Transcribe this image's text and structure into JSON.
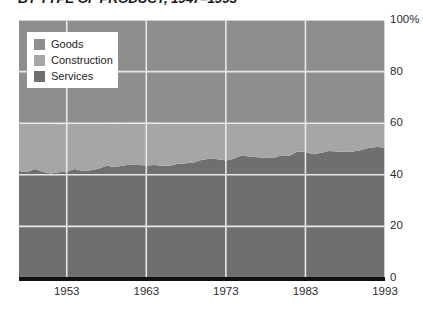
{
  "title": "BY TYPE OF PRODUCT, 1947–1993",
  "colors": {
    "goods": "#8e8e8e",
    "construction": "#a6a6a6",
    "services": "#6f6f6f",
    "gridline": "#e8e8e8",
    "baseline": "#111111",
    "text": "#2b2b2b",
    "legend_background": "#ffffff"
  },
  "legend": {
    "position": "top-left",
    "items": [
      {
        "label": "Goods",
        "color": "#8e8e8e",
        "key": "goods"
      },
      {
        "label": "Construction",
        "color": "#a6a6a6",
        "key": "construction"
      },
      {
        "label": "Services",
        "color": "#6f6f6f",
        "key": "services"
      }
    ]
  },
  "axes": {
    "y_ticks": [
      "100%",
      "80",
      "60",
      "40",
      "20",
      "0"
    ],
    "y_values": [
      100,
      80,
      60,
      40,
      20,
      0
    ],
    "x_ticks": [
      "1953",
      "1963",
      "1973",
      "1983",
      "1993"
    ],
    "x_values": [
      1953,
      1963,
      1973,
      1983,
      1993
    ]
  },
  "chart_data": {
    "type": "area",
    "stacked": true,
    "normalized": true,
    "title": "BY TYPE OF PRODUCT, 1947–1993",
    "xlabel": "",
    "ylabel": "",
    "xlim": [
      1947,
      1993
    ],
    "ylim": [
      0,
      100
    ],
    "grid": true,
    "legend_position": "top-left",
    "x": [
      1947,
      1948,
      1949,
      1950,
      1951,
      1952,
      1953,
      1954,
      1955,
      1956,
      1957,
      1958,
      1959,
      1960,
      1961,
      1962,
      1963,
      1964,
      1965,
      1966,
      1967,
      1968,
      1969,
      1970,
      1971,
      1972,
      1973,
      1974,
      1975,
      1976,
      1977,
      1978,
      1979,
      1980,
      1981,
      1982,
      1983,
      1984,
      1985,
      1986,
      1987,
      1988,
      1989,
      1990,
      1991,
      1992,
      1993
    ],
    "series": [
      {
        "name": "Services",
        "color": "#6f6f6f",
        "values": [
          41.5,
          41.0,
          42.2,
          41.2,
          40.5,
          41.0,
          41.3,
          42.2,
          41.5,
          41.8,
          42.3,
          43.5,
          43.0,
          43.5,
          44.0,
          43.8,
          43.6,
          43.8,
          43.5,
          43.5,
          44.3,
          44.5,
          44.8,
          45.8,
          46.2,
          46.0,
          45.5,
          46.2,
          47.6,
          47.0,
          46.8,
          46.6,
          46.5,
          47.6,
          47.4,
          49.0,
          48.8,
          48.0,
          48.5,
          49.2,
          49.0,
          48.8,
          49.0,
          49.6,
          50.5,
          50.8,
          50.6
        ]
      },
      {
        "name": "Construction",
        "color": "#a6a6a6",
        "values": [
          18.5,
          18.8,
          17.8,
          19.0,
          19.2,
          18.6,
          18.2,
          17.8,
          18.4,
          18.0,
          17.4,
          16.6,
          17.2,
          16.6,
          16.2,
          16.4,
          16.6,
          16.4,
          16.6,
          16.3,
          15.5,
          15.3,
          15.0,
          14.0,
          13.8,
          14.2,
          14.5,
          13.6,
          12.2,
          12.8,
          13.0,
          13.4,
          13.5,
          12.2,
          12.4,
          10.8,
          11.0,
          11.8,
          11.3,
          10.6,
          10.8,
          11.0,
          10.8,
          10.2,
          9.3,
          9.0,
          9.2
        ]
      },
      {
        "name": "Goods",
        "color": "#8e8e8e",
        "values": [
          40.0,
          40.2,
          40.0,
          39.8,
          40.3,
          40.4,
          40.5,
          40.0,
          40.1,
          40.2,
          40.3,
          39.9,
          39.8,
          39.9,
          39.8,
          39.8,
          39.8,
          39.8,
          39.9,
          40.2,
          40.2,
          40.2,
          40.2,
          40.2,
          40.0,
          39.8,
          40.0,
          40.2,
          40.2,
          40.2,
          40.2,
          40.0,
          40.0,
          40.2,
          40.2,
          40.2,
          40.2,
          40.2,
          40.2,
          40.2,
          40.2,
          40.2,
          40.2,
          40.2,
          40.2,
          40.2,
          40.2
        ]
      }
    ]
  }
}
